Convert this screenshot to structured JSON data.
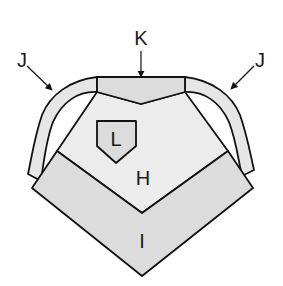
{
  "diagram": {
    "colors": {
      "stroke": "#111111",
      "band_fill": "#dcdcdc",
      "body_fill": "#ececec",
      "arm_fill": "#e6e6e6",
      "inner_fill": "#f4f4f4",
      "background": "#ffffff"
    },
    "labels": {
      "j_left": "J",
      "j_right": "J",
      "k": "K",
      "l": "L",
      "h": "H",
      "i": "I"
    }
  }
}
